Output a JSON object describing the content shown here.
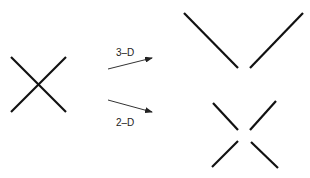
{
  "diagram": {
    "labels": {
      "arrow_top": "3–D",
      "arrow_bottom": "2–D"
    },
    "colors": {
      "stroke": "#111111",
      "arrow": "#333333",
      "background": "#ffffff"
    },
    "shapes": {
      "left_crossing": "two crossing line segments (X)",
      "top_result": "separated strands forming a V (3-D resolution)",
      "bottom_result": "four segments with gap at center (2-D resolution)"
    }
  }
}
